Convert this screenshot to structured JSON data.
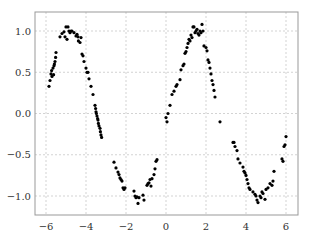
{
  "chart_data": {
    "type": "scatter",
    "title": "",
    "xlabel": "",
    "ylabel": "",
    "xlim": [
      -6.6,
      6.6
    ],
    "ylim": [
      -1.24,
      1.23
    ],
    "grid": true,
    "legend": null,
    "xticks": [
      -6,
      -4,
      -2,
      0,
      2,
      4,
      6
    ],
    "xtick_labels": [
      "−6",
      "−4",
      "−2",
      "0",
      "2",
      "4",
      "6"
    ],
    "yticks": [
      1.0,
      0.5,
      0.0,
      -0.5,
      -1.0
    ],
    "ytick_labels": [
      "1.0",
      "0.5",
      "0.0",
      "−0.5",
      "−1.0"
    ],
    "marker_color": "#000000",
    "series": [
      {
        "name": "sin(x) + noise",
        "points": [
          [
            -5.85,
            0.33
          ],
          [
            -5.8,
            0.4
          ],
          [
            -5.75,
            0.48
          ],
          [
            -5.72,
            0.52
          ],
          [
            -5.7,
            0.45
          ],
          [
            -5.65,
            0.55
          ],
          [
            -5.62,
            0.47
          ],
          [
            -5.6,
            0.58
          ],
          [
            -5.58,
            0.6
          ],
          [
            -5.55,
            0.63
          ],
          [
            -5.52,
            0.68
          ],
          [
            -5.5,
            0.74
          ],
          [
            -5.3,
            0.93
          ],
          [
            -5.2,
            0.97
          ],
          [
            -5.1,
            0.99
          ],
          [
            -5.05,
            0.93
          ],
          [
            -5.0,
            1.05
          ],
          [
            -4.95,
            0.9
          ],
          [
            -4.9,
            1.05
          ],
          [
            -4.85,
            1.0
          ],
          [
            -4.8,
            0.98
          ],
          [
            -4.75,
            1.0
          ],
          [
            -4.7,
            1.0
          ],
          [
            -4.6,
            0.98
          ],
          [
            -4.5,
            0.94
          ],
          [
            -4.45,
            0.96
          ],
          [
            -4.4,
            0.93
          ],
          [
            -4.38,
            0.88
          ],
          [
            -4.3,
            0.86
          ],
          [
            -4.25,
            0.92
          ],
          [
            -4.2,
            0.72
          ],
          [
            -4.15,
            0.7
          ],
          [
            -4.1,
            0.63
          ],
          [
            -4.0,
            0.55
          ],
          [
            -3.95,
            0.5
          ],
          [
            -3.9,
            0.5
          ],
          [
            -3.85,
            0.42
          ],
          [
            -3.75,
            0.33
          ],
          [
            -3.65,
            0.23
          ],
          [
            -3.55,
            0.1
          ],
          [
            -3.52,
            0.06
          ],
          [
            -3.5,
            0.02
          ],
          [
            -3.48,
            0.0
          ],
          [
            -3.45,
            -0.03
          ],
          [
            -3.42,
            -0.06
          ],
          [
            -3.4,
            -0.08
          ],
          [
            -3.38,
            -0.12
          ],
          [
            -3.35,
            -0.15
          ],
          [
            -3.3,
            -0.18
          ],
          [
            -3.28,
            -0.22
          ],
          [
            -3.25,
            -0.26
          ],
          [
            -3.22,
            -0.29
          ],
          [
            -2.6,
            -0.59
          ],
          [
            -2.5,
            -0.66
          ],
          [
            -2.4,
            -0.71
          ],
          [
            -2.35,
            -0.74
          ],
          [
            -2.3,
            -0.78
          ],
          [
            -2.25,
            -0.8
          ],
          [
            -2.2,
            -0.82
          ],
          [
            -2.15,
            -0.9
          ],
          [
            -2.1,
            -0.92
          ],
          [
            -2.05,
            -0.9
          ],
          [
            -1.6,
            -0.94
          ],
          [
            -1.55,
            -1.0
          ],
          [
            -1.5,
            -1.02
          ],
          [
            -1.45,
            -1.01
          ],
          [
            -1.4,
            -1.09
          ],
          [
            -1.35,
            -1.02
          ],
          [
            -1.15,
            -0.99
          ],
          [
            -1.1,
            -1.05
          ],
          [
            -0.95,
            -0.87
          ],
          [
            -0.9,
            -0.85
          ],
          [
            -0.85,
            -0.84
          ],
          [
            -0.8,
            -0.8
          ],
          [
            -0.75,
            -0.88
          ],
          [
            -0.7,
            -0.79
          ],
          [
            -0.6,
            -0.74
          ],
          [
            -0.55,
            -0.67
          ],
          [
            -0.5,
            -0.58
          ],
          [
            -0.45,
            -0.56
          ],
          [
            0.0,
            -0.05
          ],
          [
            0.05,
            -0.1
          ],
          [
            0.1,
            0.0
          ],
          [
            0.2,
            0.1
          ],
          [
            0.3,
            0.23
          ],
          [
            0.4,
            0.27
          ],
          [
            0.5,
            0.33
          ],
          [
            0.55,
            0.35
          ],
          [
            0.7,
            0.41
          ],
          [
            0.75,
            0.53
          ],
          [
            0.85,
            0.58
          ],
          [
            0.9,
            0.6
          ],
          [
            0.95,
            0.73
          ],
          [
            1.0,
            0.75
          ],
          [
            1.05,
            0.8
          ],
          [
            1.1,
            0.85
          ],
          [
            1.15,
            0.9
          ],
          [
            1.2,
            0.88
          ],
          [
            1.25,
            0.95
          ],
          [
            1.3,
            0.92
          ],
          [
            1.35,
            1.05
          ],
          [
            1.4,
            1.05
          ],
          [
            1.45,
            0.98
          ],
          [
            1.5,
            1.0
          ],
          [
            1.55,
            1.02
          ],
          [
            1.6,
            0.97
          ],
          [
            1.65,
            0.95
          ],
          [
            1.7,
            1.0
          ],
          [
            1.75,
            0.98
          ],
          [
            1.8,
            1.08
          ],
          [
            1.85,
            1.0
          ],
          [
            1.9,
            0.82
          ],
          [
            2.0,
            0.8
          ],
          [
            2.05,
            0.76
          ],
          [
            2.1,
            0.65
          ],
          [
            2.15,
            0.62
          ],
          [
            2.2,
            0.55
          ],
          [
            2.25,
            0.48
          ],
          [
            2.3,
            0.4
          ],
          [
            2.35,
            0.35
          ],
          [
            2.4,
            0.28
          ],
          [
            2.45,
            0.2
          ],
          [
            2.7,
            -0.1
          ],
          [
            3.35,
            -0.35
          ],
          [
            3.4,
            -0.35
          ],
          [
            3.45,
            -0.4
          ],
          [
            3.55,
            -0.45
          ],
          [
            3.6,
            -0.55
          ],
          [
            3.7,
            -0.6
          ],
          [
            3.85,
            -0.65
          ],
          [
            3.9,
            -0.7
          ],
          [
            3.95,
            -0.72
          ],
          [
            4.0,
            -0.75
          ],
          [
            4.05,
            -0.8
          ],
          [
            4.1,
            -0.85
          ],
          [
            4.15,
            -0.9
          ],
          [
            4.2,
            -0.92
          ],
          [
            4.35,
            -0.95
          ],
          [
            4.45,
            -0.98
          ],
          [
            4.5,
            -1.0
          ],
          [
            4.55,
            -1.05
          ],
          [
            4.6,
            -1.08
          ],
          [
            4.7,
            -1.0
          ],
          [
            4.75,
            -1.02
          ],
          [
            4.8,
            -0.95
          ],
          [
            4.85,
            -0.97
          ],
          [
            4.95,
            -1.04
          ],
          [
            5.0,
            -0.92
          ],
          [
            5.1,
            -0.9
          ],
          [
            5.2,
            -0.85
          ],
          [
            5.3,
            -0.87
          ],
          [
            5.35,
            -0.82
          ],
          [
            5.4,
            -0.7
          ],
          [
            5.8,
            -0.55
          ],
          [
            5.85,
            -0.58
          ],
          [
            5.9,
            -0.4
          ],
          [
            5.95,
            -0.38
          ],
          [
            6.0,
            -0.28
          ]
        ]
      }
    ]
  }
}
